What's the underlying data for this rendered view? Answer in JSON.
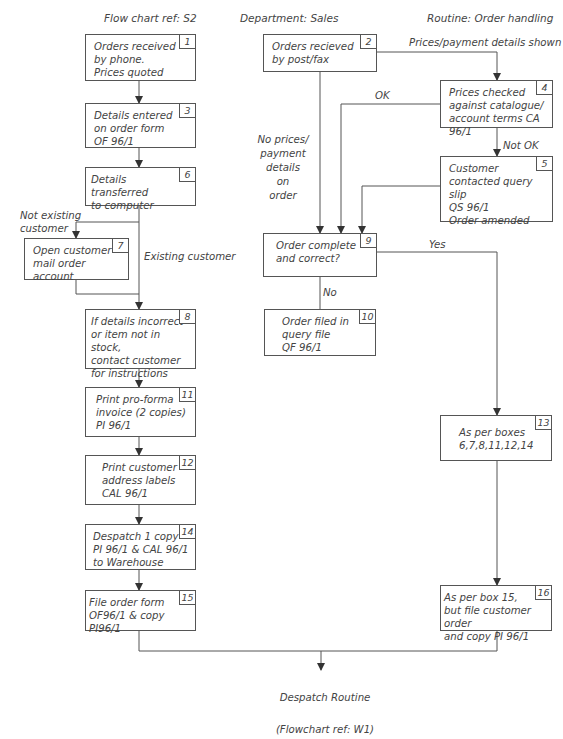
{
  "header": {
    "flowchart_ref": "Flow chart ref: S2",
    "department": "Department: Sales",
    "routine": "Routine: Order handling"
  },
  "boxes": {
    "b1": {
      "num": "1",
      "text": "Orders received\nby phone.\nPrices quoted"
    },
    "b2": {
      "num": "2",
      "text": "Orders recieved\nby post/fax"
    },
    "b3": {
      "num": "3",
      "text": "Details entered\non order form\nOF 96/1"
    },
    "b4": {
      "num": "4",
      "text": "Prices checked\nagainst catalogue/\naccount terms CA 96/1"
    },
    "b5": {
      "num": "5",
      "text": "Customer\ncontacted query slip\nQS 96/1\nOrder amended"
    },
    "b6": {
      "num": "6",
      "text": "Details transferred\nto computer"
    },
    "b7": {
      "num": "7",
      "text": "Open customer\nmail order account"
    },
    "b8": {
      "num": "8",
      "text": "If details incorrect\nor item not in stock,\ncontact customer\nfor instructions"
    },
    "b9": {
      "num": "9",
      "text": "Order complete\nand correct?"
    },
    "b10": {
      "num": "10",
      "text": "Order filed in\nquery file\nQF 96/1"
    },
    "b11": {
      "num": "11",
      "text": "Print pro-forma\ninvoice (2 copies)\nPI 96/1"
    },
    "b12": {
      "num": "12",
      "text": "Print customer\naddress labels\nCAL 96/1"
    },
    "b13": {
      "num": "13",
      "text": "As per boxes\n6,7,8,11,12,14"
    },
    "b14": {
      "num": "14",
      "text": "Despatch 1 copy\nPI 96/1 & CAL 96/1\nto Warehouse"
    },
    "b15": {
      "num": "15",
      "text": "File order form\nOF96/1 & copy PI96/1"
    },
    "b16": {
      "num": "16",
      "text": "As per box 15,\nbut file customer order\nand copy PI 96/1"
    }
  },
  "labels": {
    "prices_shown": "Prices/payment details shown",
    "ok": "OK",
    "not_ok": "Not OK",
    "no_prices": "No prices/\npayment\ndetails\non\norder",
    "not_existing": "Not existing\ncustomer",
    "existing": "Existing customer",
    "yes": "Yes",
    "no": "No"
  },
  "footer": {
    "line1": "Despatch Routine",
    "line2": "(Flowchart ref: W1)"
  }
}
